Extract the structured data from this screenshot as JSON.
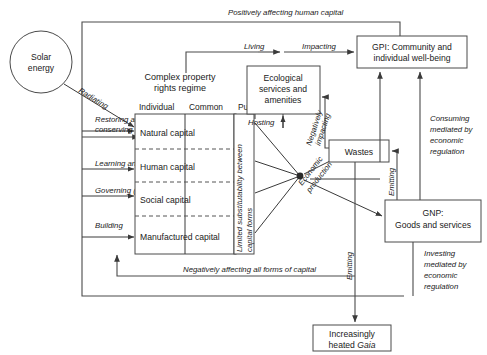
{
  "diagram": {
    "nodes": {
      "solar": "Solar\nenergy",
      "solar_l1": "Solar",
      "solar_l2": "energy",
      "regime_title_l1": "Complex property",
      "regime_title_l2": "rights regime",
      "col_individual": "Individual",
      "col_common": "Common",
      "col_public": "Public",
      "cap_natural": "Natural capital",
      "cap_human": "Human capital",
      "cap_social": "Social capital",
      "cap_manufactured": "Manufactured capital",
      "substitutability_l1": "Limited substitutability between",
      "substitutability_l2": "capital forms",
      "eco_l1": "Ecological",
      "eco_l2": "services and",
      "eco_l3": "amenities",
      "gpi_l1": "GPI: Community and",
      "gpi_l2": "individual well-being",
      "wastes": "Wastes",
      "gnp_l1": "GNP:",
      "gnp_l2": "Goods and services",
      "gaia_l1": "Increasingly",
      "gaia_l2a": "heated ",
      "gaia_l2b": "Gaia",
      "econ_prod_l1": "Economic",
      "econ_prod_l2": "production"
    },
    "edge_labels": {
      "radiating": "Radiating",
      "restoring_l1": "Restoring and",
      "restoring_l2": "conserving",
      "learning": "Learning and research",
      "governing": "Governing (Civil society)",
      "building": "Building",
      "living": "Living",
      "impacting": "Impacting",
      "hosting": "Hosting",
      "negatively_impacting_l1": "Negatively",
      "negatively_impacting_l2": "impacting",
      "positively_affecting": "Positively affecting human capital",
      "negatively_affecting": "Negatively affecting all forms of capital",
      "consuming_l1": "Consuming",
      "consuming_l2": "mediated by",
      "consuming_l3": "economic",
      "consuming_l4": "regulation",
      "investing_l1": "Investing",
      "investing_l2": "mediated by",
      "investing_l3": "economic",
      "investing_l4": "regulation",
      "emitting_wastes": "Emitting",
      "emitting_gaia": "Emitting"
    },
    "colors": {
      "stroke": "#4a4a4a",
      "text": "#1a1a1a",
      "background": "#ffffff"
    }
  }
}
